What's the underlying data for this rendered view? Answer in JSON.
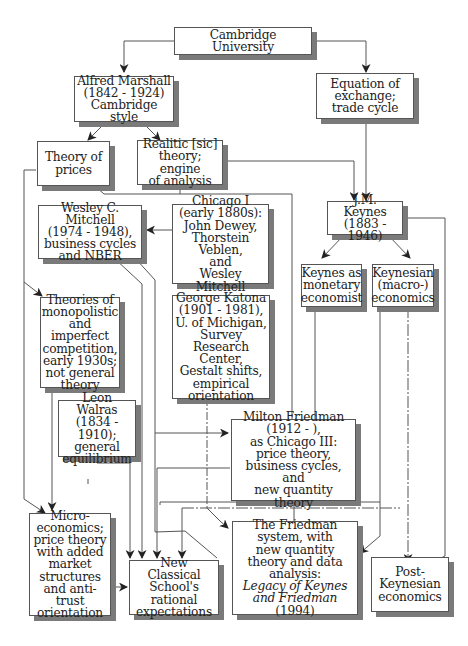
{
  "diagram": {
    "nodes": {
      "cambridge": {
        "label": "Cambridge University"
      },
      "marshall": {
        "label": "Alfred Marshall\n(1842 - 1924)\nCambridge style"
      },
      "equation": {
        "label": "Equation of\nexchange;\ntrade cycle"
      },
      "theory_prices": {
        "label": "Theory of\nprices"
      },
      "realitic": {
        "label": "Realitic [sic]\ntheory; engine\nof analysis"
      },
      "mitchell": {
        "label": "Wesley C. Mitchell\n(1974 - 1948),\nbusiness cycles\nand NBER"
      },
      "chicago1": {
        "label": "Chicago I\n(early 1880s):\nJohn Dewey,\nThorstein Veblen,\nand\nWesley Mitchell"
      },
      "keynes": {
        "label": "J.M. Keynes\n(1883 - 1946)"
      },
      "keynes_monetary": {
        "label": "Keynes as\nmonetary\neconomist"
      },
      "keynesian_macro": {
        "label": "Keynesian\n(macro-)\neconomics"
      },
      "monopolistic": {
        "label": "Theories of\nmonopolistic\nand imperfect\ncompetition,\nearly 1930s;\nnot general\ntheory"
      },
      "katona": {
        "label": "George Katona\n(1901 - 1981),\nU. of Michigan,\nSurvey\nResearch Center,\nGestalt shifts,\nempirical\norientation"
      },
      "walras": {
        "label": "Leon Walras\n(1834 - 1910);\ngeneral\nequilibrium"
      },
      "friedman": {
        "label": "Milton Friedman\n(1912 -     ),\nas Chicago III:\nprice theory,\nbusiness cycles, and\nnew quantity theory"
      },
      "micro": {
        "label": "Micro-\neconomics;\nprice theory\nwith added\nmarket\nstructures\nand anti-trust\norientation"
      },
      "new_classical": {
        "label": "New Classical\nSchool's\nrational\nexpectations"
      },
      "friedman_system": {
        "label_plain": "The Friedman\nsystem, with\nnew quantity\ntheory and data\nanalysis:",
        "label_italic_1": "Legacy of Keynes",
        "label_italic_2": "and Friedman",
        "label_year": " (1994)"
      },
      "post_keynesian": {
        "label": "Post-\nKeynesian\neconomics"
      }
    },
    "edges": [
      [
        "Cambridge University",
        "Alfred Marshall"
      ],
      [
        "Cambridge University",
        "Equation of exchange; trade cycle"
      ],
      [
        "Alfred Marshall",
        "Theory of prices"
      ],
      [
        "Alfred Marshall",
        "Realitic [sic] theory; engine of analysis"
      ],
      [
        "Equation of exchange; trade cycle",
        "J.M. Keynes"
      ],
      [
        "Realitic [sic] theory; engine of analysis",
        "J.M. Keynes"
      ],
      [
        "Realitic [sic] theory; engine of analysis",
        "Milton Friedman"
      ],
      [
        "Chicago I",
        "Wesley C. Mitchell"
      ],
      [
        "Theory of prices",
        "Theories of monopolistic and imperfect competition"
      ],
      [
        "Theory of prices",
        "Micro-economics"
      ],
      [
        "J.M. Keynes",
        "Keynes as monetary economist"
      ],
      [
        "J.M. Keynes",
        "Keynesian (macro-) economics"
      ],
      [
        "J.M. Keynes",
        "Post-Keynesian economics"
      ],
      [
        "Wesley C. Mitchell",
        "New Classical School's rational expectations"
      ],
      [
        "Wesley C. Mitchell",
        "The Friedman system"
      ],
      [
        "Theories of monopolistic competition",
        "Micro-economics"
      ],
      [
        "Leon Walras",
        "New Classical School's rational expectations"
      ],
      [
        "George Katona",
        "Post-Keynesian economics"
      ],
      [
        "Milton Friedman",
        "The Friedman system"
      ],
      [
        "Milton Friedman",
        "New Classical School's rational expectations"
      ],
      [
        "Keynes as monetary economist",
        "The Friedman system"
      ],
      [
        "Keynesian (macro-) economics",
        "Post-Keynesian economics"
      ],
      [
        "Micro-economics",
        "New Classical School's rational expectations"
      ]
    ]
  }
}
